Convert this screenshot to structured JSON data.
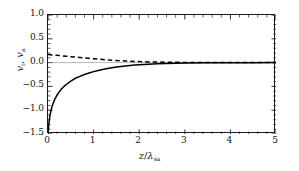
{
  "chart_data": {
    "type": "line",
    "title": "",
    "xlabel": "z/λ_sa",
    "xlabel_parts": {
      "numerator": "z",
      "slash": "/",
      "lambda": "λ",
      "subscript": "sa"
    },
    "ylabel": "v_i, v_a",
    "ylabel_parts": {
      "v1": "v",
      "sub1": "i",
      "comma": ", ",
      "v2": "v",
      "sub2": "a"
    },
    "xlim": [
      0,
      5
    ],
    "ylim": [
      -1.5,
      1.0
    ],
    "xticks": [
      0,
      1,
      2,
      3,
      4,
      5
    ],
    "xtick_labels": [
      "0",
      "1",
      "2",
      "3",
      "4",
      "5"
    ],
    "yticks": [
      1.0,
      0.5,
      0.0,
      -0.5,
      -1.0,
      -1.5
    ],
    "ytick_labels": [
      "1.0",
      "0.5",
      "0.0",
      "-0.5",
      "-1.0",
      "-1.5"
    ],
    "minor_xticks_per_interval": 5,
    "minor_yticks_per_interval": 5,
    "grid": false,
    "legend": null,
    "zero_line": {
      "y": 0.0,
      "style": "solid",
      "color": "#888888",
      "width": 0.6
    },
    "series": [
      {
        "name": "v_i",
        "style": "solid",
        "color": "#000000",
        "width": 1.5,
        "x": [
          0.0,
          0.02,
          0.04,
          0.06,
          0.08,
          0.1,
          0.13,
          0.16,
          0.2,
          0.25,
          0.3,
          0.35,
          0.4,
          0.5,
          0.6,
          0.7,
          0.8,
          0.9,
          1.0,
          1.1,
          1.2,
          1.3,
          1.4,
          1.5,
          1.6,
          1.7,
          1.8,
          1.9,
          2.0,
          2.2,
          2.4,
          2.6,
          2.8,
          3.0,
          3.5,
          4.0,
          4.5,
          5.0
        ],
        "y": [
          -1.5,
          -1.27,
          -1.13,
          -1.03,
          -0.95,
          -0.89,
          -0.81,
          -0.75,
          -0.68,
          -0.61,
          -0.55,
          -0.5,
          -0.46,
          -0.39,
          -0.33,
          -0.29,
          -0.25,
          -0.22,
          -0.19,
          -0.165,
          -0.143,
          -0.124,
          -0.108,
          -0.094,
          -0.081,
          -0.07,
          -0.061,
          -0.053,
          -0.046,
          -0.034,
          -0.025,
          -0.019,
          -0.014,
          -0.01,
          -0.005,
          -0.002,
          -0.001,
          0.0
        ]
      },
      {
        "name": "v_a",
        "style": "dashed",
        "color": "#000000",
        "width": 1.5,
        "x": [
          0.0,
          0.1,
          0.2,
          0.3,
          0.4,
          0.5,
          0.6,
          0.7,
          0.8,
          0.9,
          1.0,
          1.1,
          1.2,
          1.3,
          1.4,
          1.5,
          1.6,
          1.7,
          1.8,
          1.9,
          2.0,
          2.2,
          2.4,
          2.6,
          2.8,
          3.0,
          3.5,
          4.0,
          4.5,
          5.0
        ],
        "y": [
          0.17,
          0.161,
          0.152,
          0.143,
          0.134,
          0.125,
          0.116,
          0.107,
          0.098,
          0.089,
          0.081,
          0.073,
          0.065,
          0.058,
          0.051,
          0.045,
          0.039,
          0.034,
          0.029,
          0.025,
          0.021,
          0.015,
          0.011,
          0.008,
          0.006,
          0.004,
          0.002,
          0.001,
          0.0,
          0.0
        ]
      }
    ],
    "colors": {
      "axis": "#1a1a1a",
      "curve": "#000000",
      "zero_line": "#888888",
      "background": "#ffffff"
    }
  }
}
